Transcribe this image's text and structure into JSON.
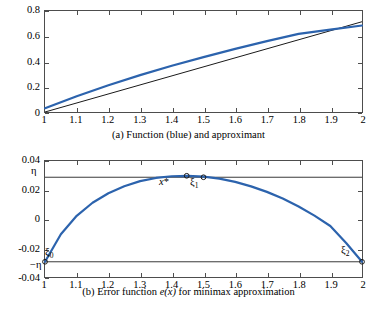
{
  "figure": {
    "caption_a": "(a) Function (blue) and approximant",
    "caption_b_prefix": "(b) Error function ",
    "caption_b_math": "e(x)",
    "caption_b_suffix": " for minimax approximation"
  },
  "panel_a": {
    "yticks": [
      "0",
      "0.2",
      "0.4",
      "0.6",
      "0.8"
    ],
    "xticks": [
      "1",
      "1.1",
      "1.2",
      "1.3",
      "1.4",
      "1.5",
      "1.6",
      "1.7",
      "1.8",
      "1.9",
      "2"
    ]
  },
  "panel_b": {
    "yticks": [
      "0.04",
      "0.02",
      "0",
      "-0.02",
      "-0.04"
    ],
    "xticks": [
      "1",
      "1.1",
      "1.2",
      "1.3",
      "1.4",
      "1.5",
      "1.6",
      "1.7",
      "1.8",
      "1.9",
      "2"
    ],
    "annotations": {
      "eta_upper": "η",
      "eta_lower": "−η",
      "xi0": "ξ",
      "xi0_sub": "0",
      "xi1": "ξ",
      "xi1_sub": "1",
      "xi2": "ξ",
      "xi2_sub": "2",
      "xstar": "x",
      "xstar_sup": "*"
    }
  },
  "colors": {
    "curve_blue": "#2c63ad",
    "curve_black": "#1a1a1a",
    "axis": "#4d4d4d",
    "guide_line": "#3a3a3a"
  },
  "chart_data": [
    {
      "type": "line",
      "title": "(a) Function (blue) and approximant",
      "xlabel": "",
      "ylabel": "",
      "xlim": [
        1,
        2
      ],
      "ylim": [
        0,
        0.8
      ],
      "grid": false,
      "legend": null,
      "xticks": [
        1,
        1.1,
        1.2,
        1.3,
        1.4,
        1.5,
        1.6,
        1.7,
        1.8,
        1.9,
        2
      ],
      "yticks": [
        0,
        0.2,
        0.4,
        0.6,
        0.8
      ],
      "series": [
        {
          "name": "Function (blue)",
          "color": "#2c63ad",
          "x": [
            1,
            1.1,
            1.2,
            1.3,
            1.4,
            1.5,
            1.6,
            1.7,
            1.8,
            1.9,
            2
          ],
          "values": [
            0.03,
            0.125,
            0.212,
            0.292,
            0.366,
            0.435,
            0.5,
            0.561,
            0.619,
            0.653,
            0.685
          ]
        },
        {
          "name": "Approximant (black)",
          "color": "#1a1a1a",
          "x": [
            1,
            2
          ],
          "values": [
            0.0,
            0.715
          ]
        }
      ]
    },
    {
      "type": "line",
      "title": "(b) Error function e(x) for minimax approximation",
      "xlabel": "",
      "ylabel": "",
      "xlim": [
        1,
        2
      ],
      "ylim": [
        -0.04,
        0.04
      ],
      "grid": false,
      "legend": null,
      "xticks": [
        1,
        1.1,
        1.2,
        1.3,
        1.4,
        1.5,
        1.6,
        1.7,
        1.8,
        1.9,
        2
      ],
      "yticks": [
        0.04,
        0.02,
        0,
        -0.02,
        -0.04
      ],
      "series": [
        {
          "name": "Error function e(x)",
          "color": "#2c63ad",
          "x": [
            1,
            1.05,
            1.1,
            1.15,
            1.2,
            1.25,
            1.3,
            1.35,
            1.4,
            1.45,
            1.5,
            1.55,
            1.6,
            1.65,
            1.7,
            1.75,
            1.8,
            1.85,
            1.9,
            1.95,
            2
          ],
          "values": [
            -0.0295,
            -0.0105,
            0.0022,
            0.0112,
            0.0178,
            0.0226,
            0.0261,
            0.0283,
            0.0295,
            0.0298,
            0.0292,
            0.0278,
            0.0256,
            0.0225,
            0.0187,
            0.0141,
            0.0086,
            0.0023,
            -0.0048,
            -0.0166,
            -0.0295
          ]
        },
        {
          "name": "Upper bound eta",
          "color": "#3a3a3a",
          "x": [
            1,
            2
          ],
          "values": [
            0.0288,
            0.0288
          ]
        },
        {
          "name": "Lower bound minus eta",
          "color": "#3a3a3a",
          "x": [
            1,
            2
          ],
          "values": [
            -0.0295,
            -0.0295
          ]
        }
      ],
      "markers": [
        {
          "label": "xi_0",
          "x": 1.0,
          "y": -0.0295
        },
        {
          "label": "x_star",
          "x": 1.447,
          "y": 0.0298
        },
        {
          "label": "xi_1",
          "x": 1.5,
          "y": 0.0288
        },
        {
          "label": "xi_2",
          "x": 2.0,
          "y": -0.0295
        }
      ]
    }
  ]
}
